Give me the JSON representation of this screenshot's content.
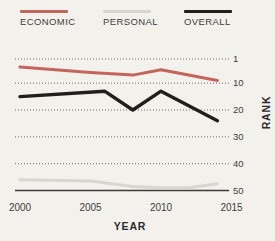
{
  "figure": {
    "background": "#f3f1ec"
  },
  "chart_data": {
    "type": "line",
    "title": "",
    "xlabel": "YEAR",
    "ylabel": "RANK",
    "x_ticks": [
      "2000",
      "2005",
      "2010",
      "2015"
    ],
    "y_ticks": [
      1,
      10,
      20,
      30,
      40,
      50
    ],
    "x_axis": {
      "min": 2000,
      "max": 2015
    },
    "y_axis": {
      "min": 1,
      "max": 50,
      "inverted": true,
      "note": "rank 1 at top, 50 at bottom"
    },
    "grid": {
      "style": "dotted-horizontal",
      "color": "#6a6a6a"
    },
    "axis_color": "#3e3d3b",
    "tick_color": "#3f3e3c",
    "background": "#f3f1ec",
    "legend_position": "top",
    "series": [
      {
        "name": "ECONOMIC",
        "color": "#c2665c",
        "width": 3,
        "points": [
          [
            2000,
            4
          ],
          [
            2005,
            6
          ],
          [
            2008,
            7
          ],
          [
            2010,
            5
          ],
          [
            2014,
            9
          ]
        ]
      },
      {
        "name": "PERSONAL",
        "color": "#d9d6cf",
        "width": 3,
        "points": [
          [
            2000,
            46
          ],
          [
            2005,
            46.5
          ],
          [
            2008,
            48.5
          ],
          [
            2010,
            49
          ],
          [
            2012,
            49
          ],
          [
            2014,
            47.5
          ]
        ]
      },
      {
        "name": "OVERALL",
        "color": "#211f1c",
        "width": 3.4,
        "points": [
          [
            2000,
            15
          ],
          [
            2006,
            13
          ],
          [
            2008,
            20
          ],
          [
            2010,
            13
          ],
          [
            2014,
            24
          ]
        ]
      }
    ]
  }
}
